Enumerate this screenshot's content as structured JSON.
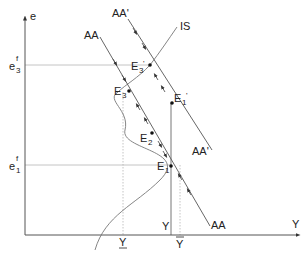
{
  "diagram": {
    "axes": {
      "y_label": "e",
      "x_label": "Y"
    },
    "y_ticks": [
      {
        "base": "e",
        "sup": "f",
        "sub": "3",
        "y": 65
      },
      {
        "base": "e",
        "sup": "f",
        "sub": "1",
        "y": 165
      }
    ],
    "x_ticks": [
      {
        "label": "Y",
        "variant": "underbar",
        "x": 123
      },
      {
        "label": "Y",
        "variant": "plain",
        "x": 171
      },
      {
        "label": "Y",
        "variant": "tilde",
        "x": 180
      }
    ],
    "curves": {
      "AA": "AA",
      "AA_prime": "AA'",
      "IS": "IS"
    },
    "points": {
      "E1": {
        "base": "E",
        "sub": "1"
      },
      "E2": {
        "base": "E",
        "sub": "2"
      },
      "E3": {
        "base": "E",
        "sub": "3"
      },
      "E1p": {
        "base": "E",
        "sub": "1",
        "prime": "'"
      },
      "E3p": {
        "base": "E",
        "sub": "3",
        "prime": "'"
      }
    },
    "colors": {
      "line": "#444444",
      "guide": "#aaaaaa",
      "text": "#222222"
    }
  }
}
